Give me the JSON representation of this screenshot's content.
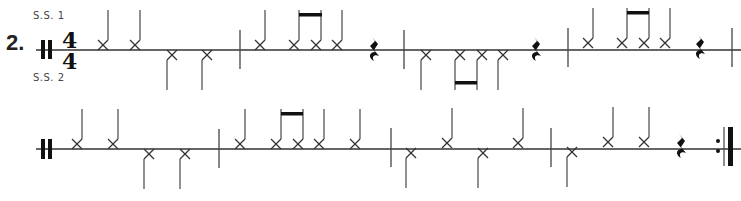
{
  "exercise": {
    "number": "2.",
    "voice_top_label": "S.S. 1",
    "voice_bottom_label": "S.S. 2",
    "time_signature": {
      "numerator": "4",
      "denominator": "4"
    },
    "start_symbol": "percussion-clef",
    "end_symbol": "repeat-end-barline"
  },
  "systems": [
    {
      "measures": [
        {
          "notes": [
            "up-quarter-x",
            "up-quarter-x",
            "down-quarter-x",
            "down-quarter-x"
          ]
        },
        {
          "notes": [
            "up-quarter-x",
            "up-eighth-x",
            "up-eighth-x",
            "up-quarter-x",
            "quarter-rest"
          ]
        },
        {
          "notes": [
            "down-quarter-x",
            "down-eighth-x",
            "down-eighth-x",
            "down-quarter-x",
            "quarter-rest"
          ]
        },
        {
          "notes": [
            "up-quarter-x",
            "up-eighth-x",
            "up-eighth-x",
            "up-quarter-x",
            "quarter-rest"
          ]
        }
      ]
    },
    {
      "measures": [
        {
          "notes": [
            "up-quarter-x",
            "up-quarter-x",
            "down-quarter-x",
            "down-quarter-x"
          ]
        },
        {
          "notes": [
            "up-quarter-x",
            "up-eighth-x",
            "up-eighth-x",
            "up-quarter-x",
            "up-quarter-x"
          ]
        },
        {
          "notes": [
            "down-quarter-x",
            "up-quarter-x",
            "down-quarter-x",
            "up-quarter-x"
          ]
        },
        {
          "notes": [
            "down-quarter-x",
            "up-quarter-x",
            "up-quarter-x",
            "quarter-rest"
          ]
        }
      ]
    }
  ],
  "colors": {
    "ink": "#1a1a1a",
    "line": "#333333"
  }
}
